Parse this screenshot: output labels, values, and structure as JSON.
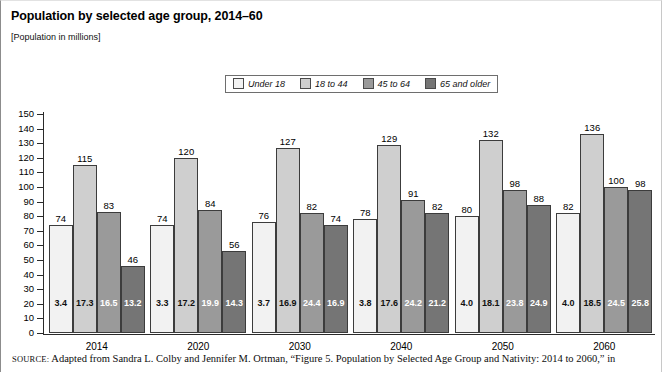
{
  "header": {
    "title": "Population by selected age group, 2014–60",
    "subtitle": "[Population in millions]"
  },
  "source": {
    "label": "SOURCE:",
    "text": " Adapted from Sandra L. Colby and Jennifer M. Ortman, “Figure 5. Population by Selected Age Group and Nativity: 2014 to 2060,” in"
  },
  "colors": {
    "series_under18": "#f2f2f2",
    "series_18to44": "#cfcfcf",
    "series_45to64": "#9a9a9a",
    "series_65plus": "#757575",
    "axis": "#2a2a2a",
    "border": "#3c3c3c",
    "background": "#ffffff"
  },
  "chart_data": {
    "type": "bar",
    "title": "Population by selected age group, 2014–60",
    "subtitle": "[Population in millions]",
    "xlabel": "",
    "ylabel": "",
    "ylim": [
      0,
      150
    ],
    "ytick_step": 10,
    "yticks": [
      0,
      10,
      20,
      30,
      40,
      50,
      60,
      70,
      80,
      90,
      100,
      110,
      120,
      130,
      140,
      150
    ],
    "grid": false,
    "legend_position": "top-center",
    "categories": [
      "2014",
      "2020",
      "2030",
      "2040",
      "2050",
      "2060"
    ],
    "series": [
      {
        "name": "Under 18",
        "color": "#f2f2f2",
        "values": [
          74,
          74,
          76,
          78,
          80,
          82
        ],
        "inner_labels": [
          "3.4",
          "3.3",
          "3.7",
          "3.8",
          "4.0",
          "4.0"
        ],
        "inner_label_color": "#111111"
      },
      {
        "name": "18 to 44",
        "color": "#cfcfcf",
        "values": [
          115,
          120,
          127,
          129,
          132,
          136
        ],
        "inner_labels": [
          "17.3",
          "17.2",
          "16.9",
          "17.6",
          "18.1",
          "18.5"
        ],
        "inner_label_color": "#111111"
      },
      {
        "name": "45 to 64",
        "color": "#9a9a9a",
        "values": [
          83,
          84,
          82,
          91,
          98,
          100
        ],
        "inner_labels": [
          "16.5",
          "19.9",
          "24.4",
          "24.2",
          "23.8",
          "24.5"
        ],
        "inner_label_color": "#ffffff"
      },
      {
        "name": "65 and older",
        "color": "#757575",
        "values": [
          46,
          56,
          74,
          82,
          88,
          98
        ],
        "inner_labels": [
          "13.2",
          "14.3",
          "16.9",
          "21.2",
          "24.9",
          "25.8"
        ],
        "inner_label_color": "#ffffff"
      }
    ]
  }
}
